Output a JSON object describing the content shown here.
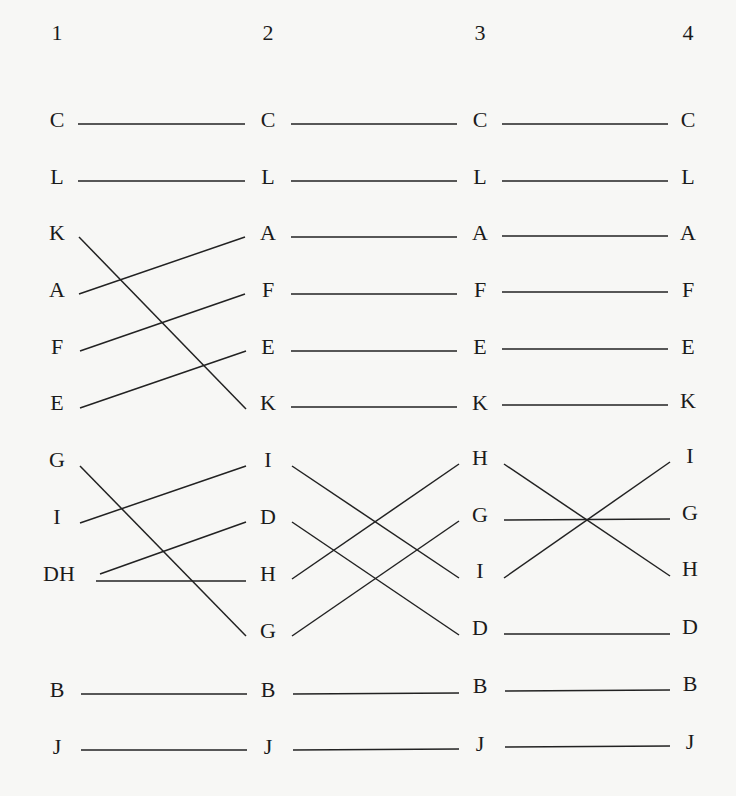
{
  "diagram": {
    "type": "permutation-crossing-diagram",
    "column_headers": [
      "1",
      "2",
      "3",
      "4"
    ],
    "columns": [
      [
        "C",
        "L",
        "K",
        "A",
        "F",
        "E",
        "G",
        "I",
        "DH",
        "",
        "B",
        "J"
      ],
      [
        "C",
        "L",
        "A",
        "F",
        "E",
        "K",
        "I",
        "D",
        "H",
        "G",
        "B",
        "J"
      ],
      [
        "C",
        "L",
        "A",
        "F",
        "E",
        "K",
        "H",
        "G",
        "I",
        "D",
        "B",
        "J"
      ],
      [
        "C",
        "L",
        "A",
        "F",
        "E",
        "K",
        "I",
        "G",
        "H",
        "D",
        "B",
        "J"
      ]
    ],
    "connections": [
      {
        "from_col": 1,
        "to_col": 2,
        "pairs": [
          [
            "C",
            "C"
          ],
          [
            "L",
            "L"
          ],
          [
            "K",
            "K"
          ],
          [
            "A",
            "A"
          ],
          [
            "F",
            "F"
          ],
          [
            "E",
            "E"
          ],
          [
            "G",
            "G"
          ],
          [
            "I",
            "I"
          ],
          [
            "DH",
            "D"
          ],
          [
            "DH",
            "H"
          ],
          [
            "B",
            "B"
          ],
          [
            "J",
            "J"
          ]
        ]
      },
      {
        "from_col": 2,
        "to_col": 3,
        "pairs": [
          [
            "C",
            "C"
          ],
          [
            "L",
            "L"
          ],
          [
            "A",
            "A"
          ],
          [
            "F",
            "F"
          ],
          [
            "E",
            "E"
          ],
          [
            "K",
            "K"
          ],
          [
            "I",
            "I"
          ],
          [
            "D",
            "D"
          ],
          [
            "H",
            "H"
          ],
          [
            "G",
            "G"
          ],
          [
            "B",
            "B"
          ],
          [
            "J",
            "J"
          ]
        ]
      },
      {
        "from_col": 3,
        "to_col": 4,
        "pairs": [
          [
            "C",
            "C"
          ],
          [
            "L",
            "L"
          ],
          [
            "A",
            "A"
          ],
          [
            "F",
            "F"
          ],
          [
            "E",
            "E"
          ],
          [
            "K",
            "K"
          ],
          [
            "H",
            "H"
          ],
          [
            "G",
            "G"
          ],
          [
            "I",
            "I"
          ],
          [
            "D",
            "D"
          ],
          [
            "B",
            "B"
          ],
          [
            "J",
            "J"
          ]
        ]
      }
    ],
    "colors": {
      "background": "#f7f7f5",
      "ink": "#1b1b1b"
    }
  }
}
